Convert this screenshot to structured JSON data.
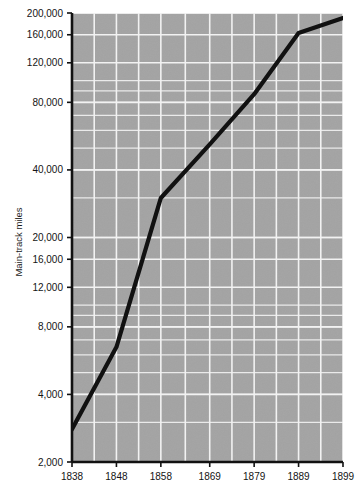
{
  "chart_data": {
    "type": "line",
    "title": "",
    "xlabel": "",
    "ylabel": "Main-track miles",
    "yscale": "log",
    "xscale": "linear",
    "grid": true,
    "legend": false,
    "xlim": [
      1838,
      1899
    ],
    "ylim": [
      2000,
      200000
    ],
    "x_ticks": [
      1838,
      1848,
      1858,
      1869,
      1879,
      1889,
      1899
    ],
    "x_tick_labels": [
      "1838",
      "1848",
      "1858",
      "1869",
      "1879",
      "1889",
      "1899"
    ],
    "y_ticks": [
      2000,
      4000,
      8000,
      12000,
      16000,
      20000,
      40000,
      80000,
      120000,
      160000,
      200000
    ],
    "y_tick_labels": [
      "2,000",
      "4,000",
      "8,000",
      "12,000",
      "16,000",
      "20,000",
      "40,000",
      "80,000",
      "120,000",
      "160,000",
      "200,000"
    ],
    "series": [
      {
        "name": "Main-track miles",
        "color": "#111111",
        "x": [
          1838,
          1848,
          1858,
          1869,
          1879,
          1889,
          1899
        ],
        "values": [
          2800,
          6500,
          30000,
          52000,
          87000,
          163000,
          190000
        ]
      }
    ]
  },
  "style": {
    "plot_background": "#a9a9a9",
    "grid_color": "#f2f2f2",
    "axis_color": "#111111",
    "line_color": "#111111",
    "page_background": "#ffffff"
  }
}
